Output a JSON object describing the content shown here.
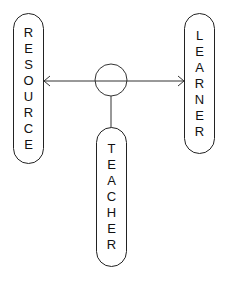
{
  "diagram": {
    "nodes": {
      "resource": {
        "label": "RESOURCE",
        "letters": [
          "R",
          "E",
          "S",
          "O",
          "U",
          "R",
          "C",
          "E"
        ]
      },
      "learner": {
        "label": "LEARNER",
        "letters": [
          "L",
          "E",
          "A",
          "R",
          "N",
          "E",
          "R"
        ]
      },
      "teacher": {
        "label": "TEACHER",
        "letters": [
          "T",
          "E",
          "A",
          "C",
          "H",
          "E",
          "R"
        ]
      }
    },
    "edges": [
      {
        "from": "resource",
        "to": "learner",
        "type": "double-arrow",
        "via": "hub-circle"
      },
      {
        "from": "hub-circle",
        "to": "teacher",
        "type": "line"
      }
    ],
    "colors": {
      "stroke": "#222222",
      "background": "#ffffff",
      "text": "#111111"
    }
  }
}
